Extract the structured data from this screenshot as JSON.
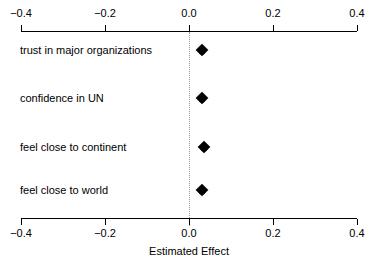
{
  "chart_data": {
    "type": "scatter",
    "title": "",
    "subtitle": "",
    "xlabel": "Estimated Effect",
    "ylabel": "",
    "xlim": [
      -0.4,
      0.4
    ],
    "grid": false,
    "legend": null,
    "zero_reference_line": 0.0,
    "marker_style": "filled-diamond",
    "marker_color": "#000000",
    "axis_positions": [
      "top",
      "bottom"
    ],
    "xticks": [
      -0.4,
      -0.2,
      0.0,
      0.2,
      0.4
    ],
    "xtick_labels": [
      "−0.4",
      "−0.2",
      "0.0",
      "0.2",
      "0.4"
    ],
    "categories": [
      "trust in major organizations",
      "confidence in UN",
      "feel close to continent",
      "feel close to world"
    ],
    "values": [
      0.03,
      0.03,
      0.035,
      0.032
    ],
    "points": [
      {
        "label": "trust in major organizations",
        "value": 0.03
      },
      {
        "label": "confidence in UN",
        "value": 0.03
      },
      {
        "label": "feel close to continent",
        "value": 0.035
      },
      {
        "label": "feel close to world",
        "value": 0.032
      }
    ]
  },
  "axis": {
    "top_labels": [
      "−0.4",
      "−0.2",
      "0.0",
      "0.2",
      "0.4"
    ],
    "bottom_labels": [
      "−0.4",
      "−0.2",
      "0.0",
      "0.2",
      "0.4"
    ],
    "title": "Estimated Effect"
  },
  "rows": [
    {
      "label": "trust in major organizations"
    },
    {
      "label": "confidence in UN"
    },
    {
      "label": "feel close to continent"
    },
    {
      "label": "feel close to world"
    }
  ]
}
